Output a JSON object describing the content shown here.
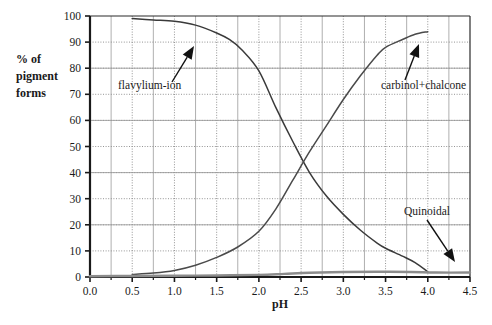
{
  "chart_data": {
    "type": "line",
    "title": "",
    "xlabel": "pH",
    "ylabel": "% of pigment forms",
    "xlim": [
      0.0,
      4.5
    ],
    "ylim": [
      0,
      100
    ],
    "grid": true,
    "grid_style": "dotted",
    "legend_position": "inline-annotations",
    "xticks": [
      "0.0",
      "0.5",
      "1.0",
      "1.5",
      "2.0",
      "2.5",
      "3.0",
      "3.5",
      "4.0",
      "4.5"
    ],
    "xtick_values": [
      0.0,
      0.5,
      1.0,
      1.5,
      2.0,
      2.5,
      3.0,
      3.5,
      4.0,
      4.5
    ],
    "yticks": [
      "0",
      "10",
      "20",
      "30",
      "40",
      "50",
      "60",
      "70",
      "80",
      "90",
      "100"
    ],
    "ytick_values": [
      0,
      10,
      20,
      30,
      40,
      50,
      60,
      70,
      80,
      90,
      100
    ],
    "series": [
      {
        "name": "flavylium-ion",
        "color": "#3a3a3a",
        "x": [
          0.5,
          0.75,
          1.0,
          1.25,
          1.5,
          1.65,
          1.8,
          2.0,
          2.2,
          2.4,
          2.6,
          2.8,
          3.0,
          3.2,
          3.4,
          3.5,
          3.7,
          3.85,
          4.0
        ],
        "y": [
          99,
          98.5,
          98,
          96.5,
          93.5,
          91,
          87,
          79,
          65,
          52,
          40,
          31,
          24,
          18,
          13,
          11,
          8,
          5.5,
          2
        ]
      },
      {
        "name": "carbinol+chalcone",
        "color": "#4a4a4a",
        "x": [
          0.5,
          0.75,
          1.0,
          1.25,
          1.5,
          1.75,
          2.0,
          2.2,
          2.4,
          2.6,
          2.8,
          3.0,
          3.2,
          3.4,
          3.5,
          3.7,
          3.85,
          4.0
        ],
        "y": [
          1,
          1.5,
          2.5,
          4.5,
          7.5,
          11.5,
          17.5,
          26,
          37,
          48,
          58,
          68,
          77,
          85,
          88,
          91,
          93,
          94
        ]
      },
      {
        "name": "Quinoidal",
        "color": "#8c8c8c",
        "x": [
          0.0,
          0.5,
          1.0,
          1.5,
          2.0,
          2.3,
          2.6,
          3.0,
          3.4,
          3.8,
          4.1,
          4.5
        ],
        "y": [
          0.3,
          0.4,
          0.5,
          0.6,
          0.8,
          1.2,
          1.6,
          1.9,
          2.0,
          1.9,
          1.7,
          1.7
        ]
      }
    ],
    "annotations": [
      {
        "text": "flavylium-ion",
        "label_x": 118,
        "label_y": 89,
        "arrow_from_x": 172,
        "arrow_from_y": 82,
        "arrow_to_x": 194,
        "arrow_to_y": 46
      },
      {
        "text": "carbinol+chalcone",
        "label_x": 381,
        "label_y": 89,
        "arrow_from_x": 405,
        "arrow_from_y": 80,
        "arrow_to_x": 419,
        "arrow_to_y": 44
      },
      {
        "text": "Quinoidal",
        "label_x": 404,
        "label_y": 215,
        "arrow_from_x": 427,
        "arrow_from_y": 220,
        "arrow_to_x": 455,
        "arrow_to_y": 262
      }
    ]
  }
}
